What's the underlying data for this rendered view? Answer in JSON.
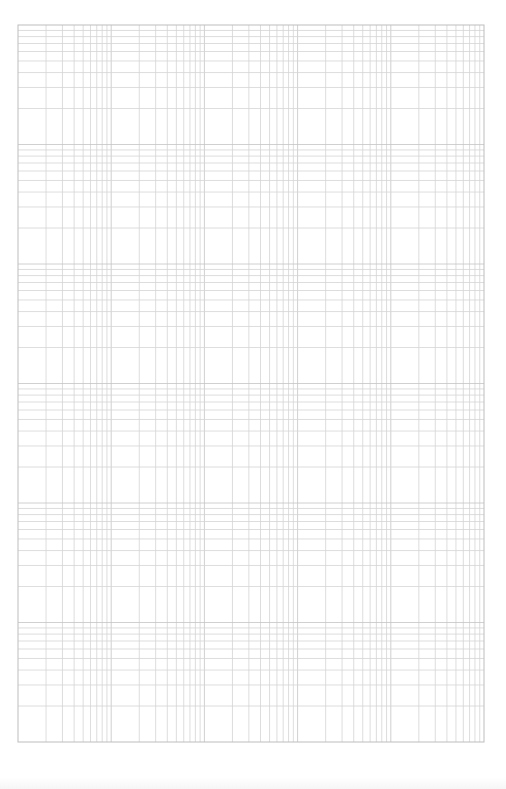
{
  "page": {
    "type": "log-log graph paper",
    "background_color": "#ffffff",
    "line_color": "#d4d4d4",
    "major_line_color": "#c4c4c4",
    "border_color": "#bdbdbd"
  },
  "grid": {
    "left": 18,
    "top": 25,
    "right": 484,
    "bottom": 742,
    "horizontal_cycles": 5,
    "vertical_cycles": 6,
    "subdivisions": [
      2,
      3,
      4,
      5,
      6,
      7,
      8,
      9
    ]
  }
}
